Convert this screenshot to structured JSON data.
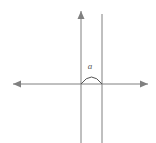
{
  "figure": {
    "width": 156,
    "height": 143,
    "background_color": "#ffffff",
    "stroke_color": "#808080",
    "label_color": "#555555",
    "caption": ""
  },
  "axes": {
    "x_axis": {
      "name": "horizontal-axis",
      "y": 84,
      "x_start": 13,
      "x_end": 148,
      "arrow_start": true,
      "arrow_end": true
    },
    "y_axis": {
      "name": "vertical-axis",
      "x": 81,
      "y_start": 11,
      "y_end": 143,
      "arrow_start": true,
      "arrow_end": false
    }
  },
  "lines": [
    {
      "name": "second-vertical-line",
      "x": 102,
      "y_start": 14,
      "y_end": 143,
      "arrow_start": false,
      "arrow_end": false
    }
  ],
  "angle": {
    "arc": {
      "x_start": 81,
      "x_end": 102,
      "y_base": 84,
      "peak_y": 77
    },
    "label": {
      "text": "a",
      "x": 90,
      "y": 66
    }
  }
}
